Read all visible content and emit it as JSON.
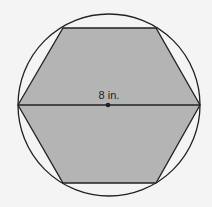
{
  "diagram": {
    "diameter_label": "8 in.",
    "colors": {
      "background": "#f4f4f4",
      "hexagon_fill": "#b4b4b4",
      "stroke": "#222222"
    },
    "circle": {
      "cx": 109,
      "cy": 105,
      "r": 91
    },
    "hexagon_points": "18,105 63,28 156,28 200,105 156,183 63,183",
    "diameter": {
      "x1": 18,
      "y1": 105,
      "x2": 200,
      "y2": 105
    },
    "center_point": {
      "x": 108,
      "y": 105
    }
  }
}
